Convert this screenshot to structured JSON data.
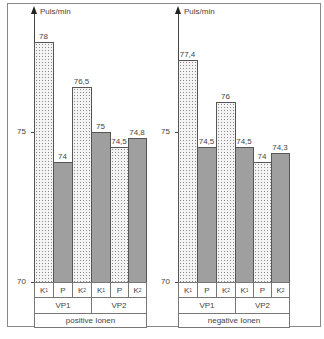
{
  "chart_data": [
    {
      "type": "bar",
      "title": "",
      "ylabel": "Puls/min",
      "ylim": [
        70,
        78.5
      ],
      "yticks": [
        70,
        75
      ],
      "categories": [
        "K1",
        "P",
        "K2",
        "K1",
        "P",
        "K2"
      ],
      "groups": [
        "VP1",
        "VP2"
      ],
      "group_label": "positive Ionen",
      "values": [
        78,
        74,
        76.5,
        75,
        74.5,
        74.8
      ],
      "value_labels": [
        "78",
        "74",
        "76,5",
        "75",
        "74,5",
        "74,8"
      ]
    },
    {
      "type": "bar",
      "title": "",
      "ylabel": "Puls/min",
      "ylim": [
        70,
        78.5
      ],
      "yticks": [
        70,
        75
      ],
      "categories": [
        "K1",
        "P",
        "K2",
        "K1",
        "P",
        "K2"
      ],
      "groups": [
        "VP1",
        "VP2"
      ],
      "group_label": "negative Ionen",
      "values": [
        77.4,
        74.5,
        76,
        74.5,
        74,
        74.3
      ],
      "value_labels": [
        "77,4",
        "74,5",
        "76",
        "74,5",
        "74",
        "74,3"
      ]
    }
  ],
  "left": {
    "unit": "Puls/min",
    "tick_70": "70",
    "tick_75": "75",
    "labels": [
      "78",
      "74",
      "76,5",
      "75",
      "74,5",
      "74,8"
    ],
    "cats": [
      {
        "m": "K",
        "s": "1"
      },
      {
        "m": "P",
        "s": ""
      },
      {
        "m": "K",
        "s": "2"
      },
      {
        "m": "K",
        "s": "1"
      },
      {
        "m": "P",
        "s": ""
      },
      {
        "m": "K",
        "s": "2"
      }
    ],
    "vp1": "VP1",
    "vp2": "VP2",
    "ionen": "positive Ionen"
  },
  "right": {
    "unit": "Puls/min",
    "tick_70": "70",
    "tick_75": "75",
    "labels": [
      "77,4",
      "74,5",
      "76",
      "74,5",
      "74",
      "74,3"
    ],
    "cats": [
      {
        "m": "K",
        "s": "1"
      },
      {
        "m": "P",
        "s": ""
      },
      {
        "m": "K",
        "s": "2"
      },
      {
        "m": "K",
        "s": "1"
      },
      {
        "m": "P",
        "s": ""
      },
      {
        "m": "K",
        "s": "2"
      }
    ],
    "vp1": "VP1",
    "vp2": "VP2",
    "ionen": "negative Ionen"
  }
}
